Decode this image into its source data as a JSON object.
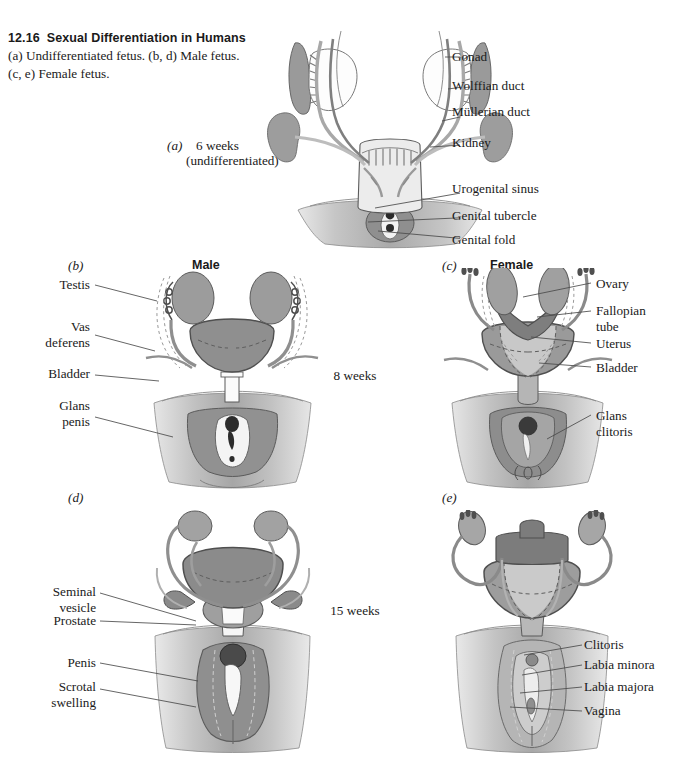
{
  "figure": {
    "number": "12.16",
    "title": "Sexual Differentiation in Humans",
    "caption_line1": "(a) Undifferentiated fetus. (b, d) Male fetus.",
    "caption_line2": "(c, e) Female fetus."
  },
  "panels": {
    "a": {
      "marker": "(a)",
      "stage_line1": "6 weeks",
      "stage_line2": "(undifferentiated)"
    },
    "b": {
      "marker": "(b)",
      "heading": "Male"
    },
    "c": {
      "marker": "(c)",
      "heading": "Female"
    },
    "d": {
      "marker": "(d)"
    },
    "e": {
      "marker": "(e)"
    }
  },
  "timeline": {
    "stage_8": "8 weeks",
    "stage_15": "15 weeks"
  },
  "labels": {
    "a_right": [
      "Gonad",
      "Wolffian duct",
      "Müllerian duct",
      "Kidney",
      "Urogenital sinus",
      "Genital tubercle",
      "Genital fold"
    ],
    "b_left": [
      "Testis",
      "Vas\ndeferens",
      "Bladder",
      "Glans\npenis"
    ],
    "c_right": [
      "Ovary",
      "Fallopian\ntube",
      "Uterus",
      "Bladder",
      "Glans\nclitoris"
    ],
    "d_left": [
      "Seminal\nvesicle",
      "Prostate",
      "Penis",
      "Scrotal\nswelling"
    ],
    "e_right": [
      "Clitoris",
      "Labia minora",
      "Labia majora",
      "Vagina"
    ]
  },
  "colors": {
    "background": "#ffffff",
    "ink": "#1a1a1a",
    "leader": "#4a4a4a",
    "outline": "#5b5b5b",
    "gray_dark": "#8c8c8c",
    "gray_mid": "#adadad",
    "gray_light": "#cfcfcf",
    "gray_pale": "#e2e2e2"
  }
}
